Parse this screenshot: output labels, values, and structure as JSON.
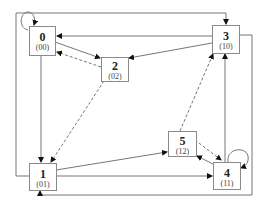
{
  "diagram": {
    "type": "state-transition-graph",
    "nodes": [
      {
        "id": "0",
        "code": "(00)"
      },
      {
        "id": "1",
        "code": "(01)"
      },
      {
        "id": "2",
        "code": "(02)"
      },
      {
        "id": "3",
        "code": "(10)"
      },
      {
        "id": "4",
        "code": "(11)"
      },
      {
        "id": "5",
        "code": "(12)"
      }
    ],
    "edges": [
      {
        "from": "0",
        "to": "0",
        "style": "solid",
        "kind": "self-loop"
      },
      {
        "from": "0",
        "to": "1",
        "style": "solid"
      },
      {
        "from": "0",
        "to": "2",
        "style": "solid"
      },
      {
        "from": "3",
        "to": "0",
        "style": "solid"
      },
      {
        "from": "3",
        "to": "2",
        "style": "solid"
      },
      {
        "from": "2",
        "to": "0",
        "style": "dashed"
      },
      {
        "from": "2",
        "to": "1",
        "style": "dashed"
      },
      {
        "from": "1",
        "to": "3",
        "style": "solid",
        "kind": "outer-route"
      },
      {
        "from": "1",
        "to": "5",
        "style": "solid"
      },
      {
        "from": "1",
        "to": "4",
        "style": "solid"
      },
      {
        "from": "5",
        "to": "4",
        "style": "dashed"
      },
      {
        "from": "4",
        "to": "5",
        "style": "solid"
      },
      {
        "from": "5",
        "to": "3",
        "style": "dashed"
      },
      {
        "from": "4",
        "to": "3",
        "style": "solid"
      },
      {
        "from": "4",
        "to": "4",
        "style": "solid",
        "kind": "self-loop"
      },
      {
        "from": "3",
        "to": "1",
        "style": "solid",
        "kind": "outer-route"
      }
    ]
  }
}
